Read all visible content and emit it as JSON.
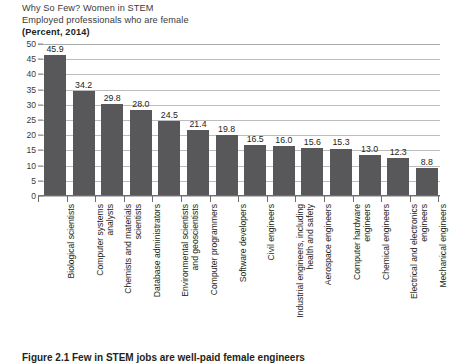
{
  "header": {
    "title": "Why So Few? Women in STEM",
    "subtitle": "Employed professionals who are female",
    "units": "(Percent, 2014)"
  },
  "caption": {
    "figure_label": "Figure 2.1",
    "text": "Figure 2.1  Few in STEM jobs are well-paid female engineers"
  },
  "chart_data": {
    "type": "bar",
    "title": "Why So Few? Women in STEM",
    "subtitle": "Employed professionals who are female",
    "xlabel": "",
    "ylabel": "Percent",
    "ylim": [
      0,
      50
    ],
    "yticks": [
      0,
      5,
      10,
      15,
      20,
      25,
      30,
      35,
      40,
      45,
      50
    ],
    "ytick_labels": [
      "0",
      "5",
      "10",
      "15",
      "20",
      "25",
      "30",
      "35",
      "40",
      "45",
      "50"
    ],
    "grid": true,
    "legend": false,
    "bar_color": "#58585a",
    "categories": [
      "Biological scientists",
      "Computer systems\nanalysts",
      "Chemists and materials\nscientists",
      "Database administrators",
      "Environmental scientists\nand geoscientists",
      "Computer programmers",
      "Software developers",
      "Civil engineers",
      "Industrial engineers, including\nhealth and safety",
      "Aerospace engineers",
      "Computer hardware\nengineers",
      "Chemical engineers",
      "Electrical and electronics\nengineers",
      "Mechanical engineers"
    ],
    "values": [
      45.9,
      34.2,
      29.8,
      28.0,
      24.5,
      21.4,
      19.8,
      16.5,
      16.0,
      15.6,
      15.3,
      13.0,
      12.3,
      8.8
    ],
    "value_labels": [
      "45.9",
      "34.2",
      "29.8",
      "28.0",
      "24.5",
      "21.4",
      "19.8",
      "16.5",
      "16.0",
      "15.6",
      "15.3",
      "13.0",
      "12.3",
      "8.8"
    ]
  }
}
